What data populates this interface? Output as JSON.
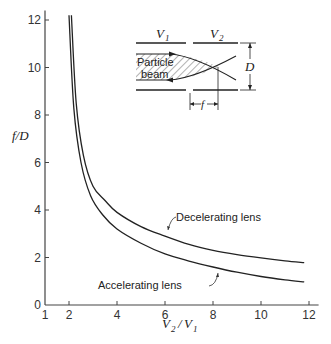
{
  "chart_data": {
    "type": "line",
    "title": "",
    "xlabel": "V2 / V1",
    "ylabel": "f / D",
    "xlim": [
      1,
      12.4
    ],
    "ylim": [
      0,
      12.4
    ],
    "xticks": [
      1,
      2,
      4,
      6,
      8,
      10,
      12
    ],
    "yticks": [
      0,
      2,
      4,
      6,
      8,
      10,
      12
    ],
    "grid": false,
    "series": [
      {
        "name": "Decelerating lens",
        "x": [
          2.1,
          2.3,
          2.6,
          3.0,
          3.5,
          4.0,
          5.0,
          6.0,
          7.0,
          8.0,
          9.0,
          10.0,
          11.0,
          11.8
        ],
        "y": [
          12.2,
          8.5,
          6.3,
          5.0,
          4.4,
          3.9,
          3.3,
          2.9,
          2.55,
          2.3,
          2.12,
          1.98,
          1.86,
          1.78
        ]
      },
      {
        "name": "Accelerating lens",
        "x": [
          2.0,
          2.2,
          2.5,
          2.9,
          3.4,
          4.0,
          5.0,
          6.0,
          7.0,
          8.0,
          9.0,
          10.0,
          11.0,
          11.8
        ],
        "y": [
          12.2,
          8.3,
          6.0,
          4.6,
          3.8,
          3.2,
          2.6,
          2.15,
          1.85,
          1.6,
          1.38,
          1.2,
          1.06,
          0.97
        ]
      }
    ],
    "annotations": [
      "Decelerating lens",
      "Accelerating lens"
    ],
    "inset": {
      "labels": [
        "V1",
        "V2",
        "Particle beam",
        "D",
        "f"
      ]
    }
  },
  "labels": {
    "ylabel": "f/D",
    "xlabel_v2": "V",
    "xlabel_sub2": "2",
    "xlabel_sep": "/",
    "xlabel_v1": "V",
    "xlabel_sub1": "1",
    "decel": "Decelerating lens",
    "accel": "Accelerating lens",
    "inset_v1": "V",
    "inset_v1_sub": "1",
    "inset_v2": "V",
    "inset_v2_sub": "2",
    "inset_particle": "Particle",
    "inset_beam": "beam",
    "inset_d": "D",
    "inset_f": "f"
  }
}
